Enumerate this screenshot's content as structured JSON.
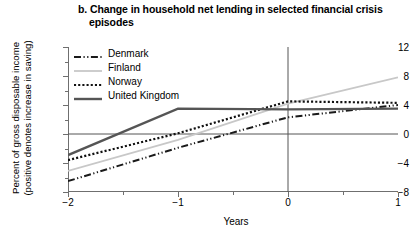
{
  "chart_data": {
    "type": "line",
    "title": "b. Change in household net lending in selected financial crisis episodes",
    "title_line1": "b. Change in household net lending in selected financial crisis",
    "title_line2": "episodes",
    "xlabel": "Years",
    "ylabel": "Percent of gross disposable income (positive denotes increase in saving)",
    "ylabel_line1": "Percent of gross disposable income",
    "ylabel_line2": "(positive denotes increase in saving)",
    "x": [
      -2,
      -1,
      0,
      1
    ],
    "xlim": [
      -2,
      1
    ],
    "ylim": [
      -8,
      12
    ],
    "xticks": [
      -2,
      -1,
      0,
      1
    ],
    "xtick_labels": [
      "−2",
      "−1",
      "0",
      "1"
    ],
    "yticks": [
      -8,
      -4,
      0,
      4,
      8,
      12
    ],
    "ytick_labels": [
      "−8",
      "−4",
      "0",
      "4",
      "8",
      "12"
    ],
    "grid": false,
    "legend_position": "upper-left",
    "zero_line": true,
    "vertical_marker_x": 0,
    "series": [
      {
        "name": "Denmark",
        "style": "dash-dot-dot",
        "color": "#1a1a1a",
        "width": 2,
        "values": [
          -6.5,
          -1.9,
          2.3,
          4.0
        ]
      },
      {
        "name": "Finland",
        "style": "solid",
        "color": "#c8c8c8",
        "width": 1.8,
        "values": [
          -5.1,
          -0.8,
          4.2,
          7.8
        ]
      },
      {
        "name": "Norway",
        "style": "dotted",
        "color": "#111111",
        "width": 2.2,
        "values": [
          -3.6,
          0.1,
          4.5,
          4.3
        ]
      },
      {
        "name": "United Kingdom",
        "style": "solid",
        "color": "#555555",
        "width": 2.4,
        "values": [
          -2.9,
          3.5,
          3.4,
          3.5
        ]
      }
    ]
  },
  "axis": {
    "frame_color": "#6f6f6f",
    "zero_line_color": "#555555"
  }
}
